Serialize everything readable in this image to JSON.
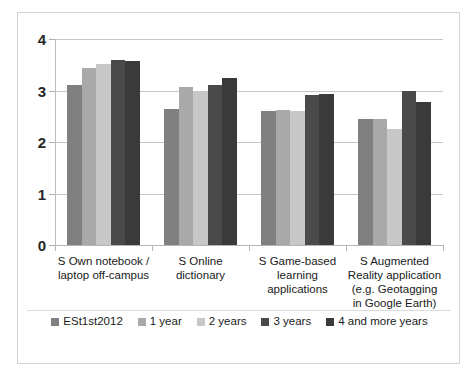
{
  "chart_data": {
    "type": "bar",
    "title": "",
    "subtitle": "",
    "xlabel": "",
    "ylabel": "",
    "ylim": [
      0,
      4
    ],
    "y_ticks": [
      "0",
      "1",
      "2",
      "3",
      "4"
    ],
    "grid": true,
    "legend_position": "bottom",
    "categories": [
      "S Own notebook /\nlaptop off-campus",
      "S Online\ndictionary",
      "S Game-based\nlearning\napplications",
      "S Augmented\nReality application\n(e.g. Geotagging\nin Google Earth)"
    ],
    "series": [
      {
        "name": "ESt1st2012",
        "color": "#808080",
        "values": [
          3.1,
          2.65,
          2.6,
          2.45
        ]
      },
      {
        "name": "1 year",
        "color": "#a9a9a9",
        "values": [
          3.43,
          3.07,
          2.62,
          2.45
        ]
      },
      {
        "name": "2 years",
        "color": "#c8c8c8",
        "values": [
          3.52,
          3.0,
          2.6,
          2.25
        ]
      },
      {
        "name": "3 years",
        "color": "#4a4a4a",
        "values": [
          3.6,
          3.1,
          2.92,
          3.0
        ]
      },
      {
        "name": "4 and more years",
        "color": "#3a3a3a",
        "values": [
          3.58,
          3.25,
          2.93,
          2.78
        ]
      }
    ]
  }
}
